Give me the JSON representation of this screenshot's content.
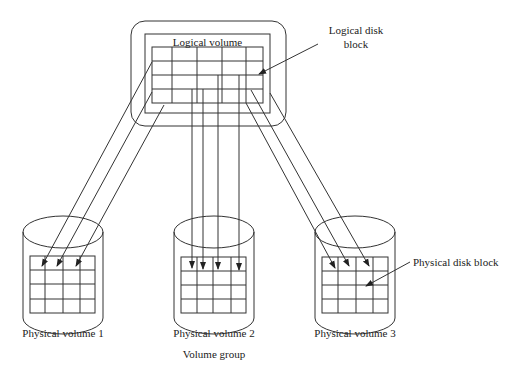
{
  "labels": {
    "logical_volume": "Logical volume",
    "logical_disk_block_line1": "Logical disk",
    "logical_disk_block_line2": "block",
    "physical_disk_block": "Physical disk block",
    "pv1": "Physical volume 1",
    "pv2": "Physical volume 2",
    "pv3": "Physical volume 3",
    "volume_group": "Volume group"
  },
  "colors": {
    "stroke": "#333333",
    "text": "#222222",
    "background": "#ffffff"
  },
  "logical_volume": {
    "rows": 4,
    "cols": 5
  },
  "physical_volumes": [
    {
      "name": "Physical volume 1",
      "rows": 4,
      "cols": 4
    },
    {
      "name": "Physical volume 2",
      "rows": 4,
      "cols": 4
    },
    {
      "name": "Physical volume 3",
      "rows": 4,
      "cols": 4
    }
  ]
}
